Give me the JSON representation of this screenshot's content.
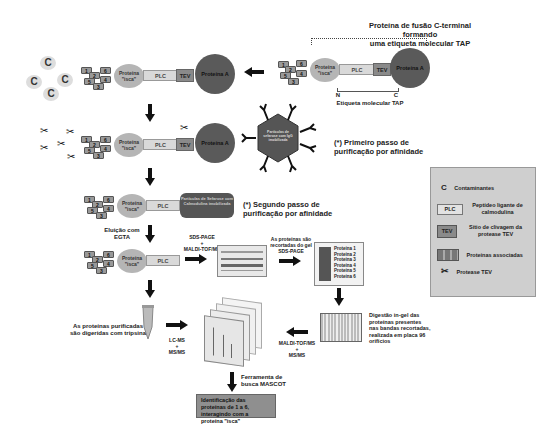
{
  "top_construct": {
    "title_line1": "Proteína de fusão C-terminal formando",
    "title_line2": "uma etiqueta molecular TAP",
    "n_label": "N",
    "c_label": "C",
    "tag_label": "Etiqueta molecular TAP"
  },
  "components": {
    "bait": "Proteína \"isca\"",
    "bait_l1": "Proteína",
    "bait_l2": "\"isca\"",
    "plc": "PLC",
    "tev": "TEV",
    "protein_a": "Proteína A",
    "contaminant": "C",
    "associated_numbers": [
      "1",
      "2",
      "3",
      "4",
      "5",
      "6"
    ]
  },
  "steps": {
    "igg_bead": "Partículas de sefarose com IgG imobilizada",
    "first_step_l1": "(*) Primeiro passo de",
    "first_step_l2": "purificação por afinidade",
    "calmodulin_bead": "Partículas de Sefarose com Calmodulina imobilizada",
    "second_step_l1": "(*) Segundo passo de",
    "second_step_l2": "purificação por afinidade",
    "elution_l1": "Eluição com",
    "elution_l2": "EGTA",
    "sds_l1": "SDS-PAGE",
    "sds_l2": "+",
    "sds_l3": "MALDI-TOF/MS",
    "cut_l1": "As proteínas são",
    "cut_l2": "recortadas do gel",
    "cut_l3": "SDS-PAGE",
    "gel_proteins": [
      "Proteína 1",
      "Proteína 2",
      "Proteína 3",
      "Proteína 4",
      "Proteína 5",
      "Proteína 6"
    ],
    "digest_l1": "Digestão in-gel das",
    "digest_l2": "proteínas presentes",
    "digest_l3": "nas bandas recortadas,",
    "digest_l4": "realizada em placa 96",
    "digest_l5": "orifícios",
    "maldi_l1": "MALDI-TOF/MS",
    "maldi_l2": "+",
    "maldi_l3": "MS/MS",
    "lcms_l1": "LC-MS",
    "lcms_l2": "+",
    "lcms_l3": "MS/MS",
    "trypsin_l1": "As proteínas purificadas",
    "trypsin_l2": "são digeridas com tripsina",
    "mascot_l1": "Ferramenta de",
    "mascot_l2": "busca MASCOT",
    "result": "Identificação das proteínas de 1 a 6, interagindo com a proteína \"isca\""
  },
  "legend": {
    "items": [
      {
        "icon": "C",
        "label": "Contaminantes"
      },
      {
        "icon": "PLC",
        "label": "Peptídeo ligante de calmodulina"
      },
      {
        "icon": "TEV",
        "label": "Sítio de clivagem da protease TEV"
      },
      {
        "icon": "associated-proteins",
        "label": "Proteínas associadas"
      },
      {
        "icon": "scissors",
        "label": "Protease TEV"
      }
    ]
  },
  "colors": {
    "protein_a": "#5a5a5a",
    "bait": "#b5b5b5",
    "plc": "#d9d9d9",
    "tev": "#8a8a8a",
    "legend_bg": "#cfcfcf",
    "bead": "#555555"
  }
}
